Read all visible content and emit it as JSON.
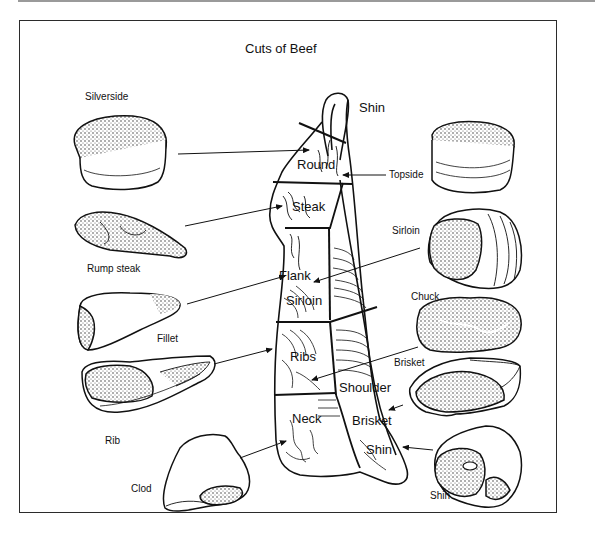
{
  "diagram": {
    "title": "Cuts of Beef",
    "carcass_regions": [
      {
        "id": "shin-hind",
        "label": "Shin"
      },
      {
        "id": "round",
        "label": "Round"
      },
      {
        "id": "steak",
        "label": "Steak"
      },
      {
        "id": "flank",
        "label": "Flank"
      },
      {
        "id": "sirloin",
        "label": "Sirloin"
      },
      {
        "id": "ribs",
        "label": "Ribs"
      },
      {
        "id": "shoulder",
        "label": "Shoulder"
      },
      {
        "id": "neck",
        "label": "Neck"
      },
      {
        "id": "brisket",
        "label": "Brisket"
      },
      {
        "id": "shin-fore",
        "label": "Shin"
      }
    ],
    "left_cuts": [
      {
        "id": "silverside",
        "label": "Silverside",
        "points_to": "Round"
      },
      {
        "id": "rump-steak",
        "label": "Rump steak",
        "points_to": "Steak"
      },
      {
        "id": "fillet",
        "label": "Fillet",
        "points_to": "Flank"
      },
      {
        "id": "rib",
        "label": "Rib",
        "points_to": "Ribs"
      },
      {
        "id": "clod",
        "label": "Clod",
        "points_to": "Neck"
      }
    ],
    "right_cuts": [
      {
        "id": "topside",
        "label": "Topside",
        "points_to": "Round"
      },
      {
        "id": "sirloin-cut",
        "label": "Sirloin",
        "points_to": "Flank"
      },
      {
        "id": "chuck",
        "label": "Chuck",
        "points_to": "Ribs"
      },
      {
        "id": "brisket-cut",
        "label": "Brisket",
        "points_to": "Brisket"
      },
      {
        "id": "shin-cut",
        "label": "Shin",
        "points_to": "Shin"
      }
    ],
    "colors": {
      "ink": "#111111",
      "background": "#ffffff",
      "frame": "#2b2b2b"
    }
  }
}
